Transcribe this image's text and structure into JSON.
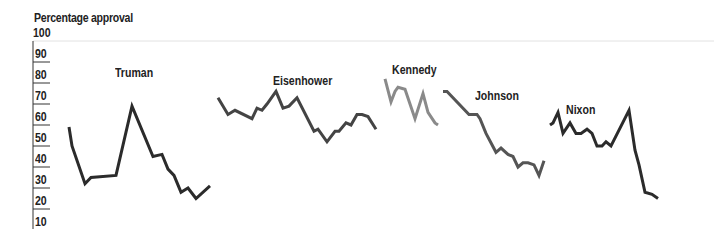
{
  "chart_data": {
    "type": "line",
    "title": "",
    "ylabel": "Percentage approval",
    "xlabel": "",
    "ylim": [
      10,
      100
    ],
    "yticks": [
      100,
      90,
      80,
      70,
      60,
      50,
      40,
      30,
      20,
      10
    ],
    "grid": false,
    "legend": "inline labels",
    "series": [
      {
        "name": "Truman",
        "color": "#2b2b2b",
        "label_pos": [
          115,
          66
        ],
        "x": [
          69,
          72,
          85,
          91,
          116,
          132,
          153,
          162,
          168,
          174,
          181,
          188,
          196,
          210
        ],
        "values": [
          59,
          50,
          32,
          35,
          36,
          69,
          45,
          46,
          39,
          36,
          28,
          30,
          25,
          31
        ]
      },
      {
        "name": "Eisenhower",
        "color": "#444444",
        "label_pos": [
          273,
          74
        ],
        "x": [
          218,
          228,
          235,
          252,
          257,
          262,
          267,
          276,
          283,
          289,
          297,
          314,
          318,
          327,
          335,
          339,
          346,
          351,
          357,
          362,
          368,
          376
        ],
        "values": [
          73,
          65,
          67,
          63,
          68,
          67,
          70,
          76,
          68,
          69,
          73,
          57,
          58,
          52,
          57,
          57,
          61,
          60,
          65,
          65,
          64,
          58
        ]
      },
      {
        "name": "Kennedy",
        "color": "#8a8a8a",
        "label_pos": [
          392,
          63
        ],
        "x": [
          385,
          391,
          395,
          398,
          405,
          415,
          423,
          428,
          435,
          438
        ],
        "values": [
          82,
          71,
          76,
          78,
          77,
          63,
          75,
          66,
          61,
          60
        ]
      },
      {
        "name": "Johnson",
        "color": "#555555",
        "label_pos": [
          475,
          89
        ],
        "x": [
          443,
          447,
          469,
          477,
          480,
          486,
          496,
          501,
          508,
          513,
          518,
          523,
          528,
          534,
          539,
          544
        ],
        "values": [
          76,
          76,
          65,
          65,
          63,
          56,
          47,
          49,
          46,
          45,
          40,
          42,
          42,
          41,
          36,
          43
        ]
      },
      {
        "name": "Nixon",
        "color": "#2b2b2b",
        "label_pos": [
          566,
          103
        ],
        "x": [
          550,
          553,
          558,
          563,
          570,
          576,
          581,
          587,
          592,
          597,
          602,
          606,
          611,
          629,
          635,
          639,
          645,
          652,
          658
        ],
        "values": [
          60,
          61,
          66,
          56,
          61,
          56,
          56,
          58,
          56,
          50,
          50,
          52,
          50,
          67,
          48,
          41,
          28,
          27,
          25
        ]
      }
    ]
  }
}
